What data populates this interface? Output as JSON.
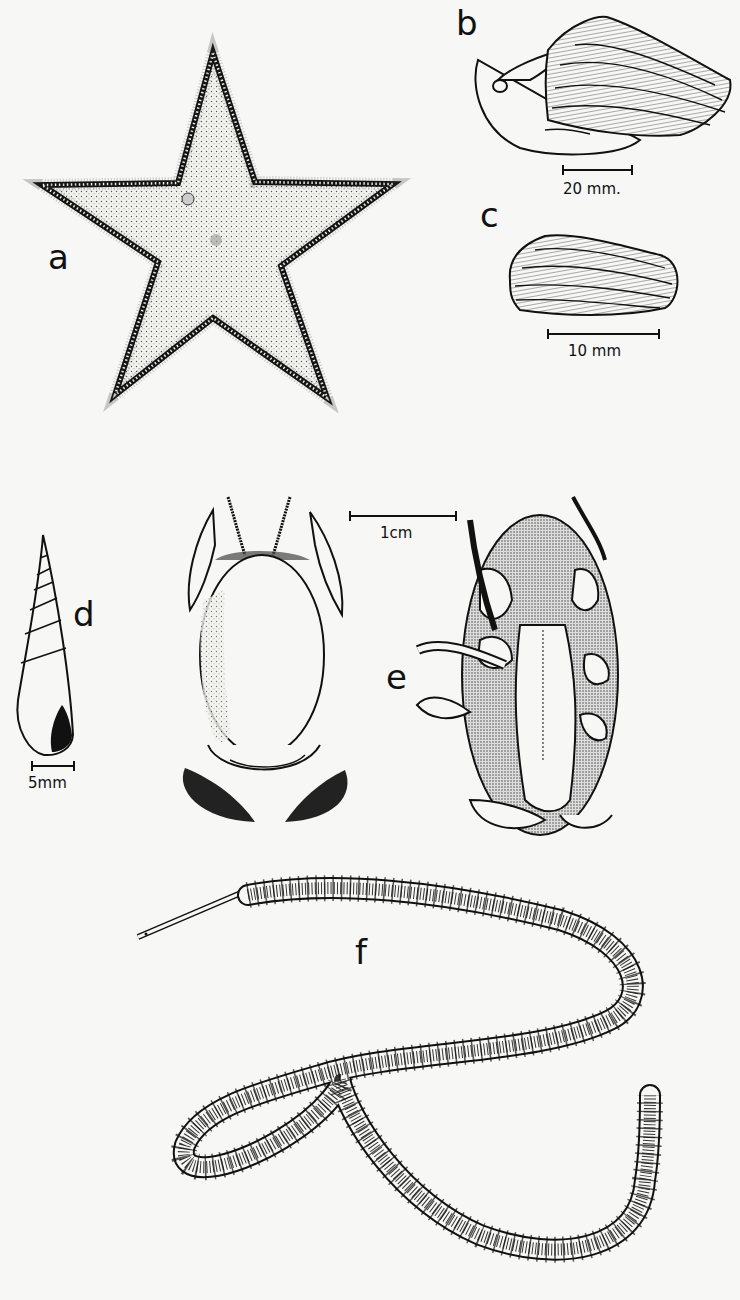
{
  "figure": {
    "panels": [
      {
        "id": "a",
        "label": "a",
        "subject": "starfish",
        "scale": null
      },
      {
        "id": "b",
        "label": "b",
        "subject": "bivalve-with-foot-extended",
        "scale": "20 mm."
      },
      {
        "id": "c",
        "label": "c",
        "subject": "bivalve-shell",
        "scale": "10 mm"
      },
      {
        "id": "d",
        "label": "d",
        "subject": "turret-snail-shell",
        "scale": "5mm"
      },
      {
        "id": "e",
        "label": "e",
        "subject": "crab-dorsal-and-ventral-views",
        "scale": "1cm"
      },
      {
        "id": "f",
        "label": "f",
        "subject": "ribbon-worm",
        "scale": null
      }
    ]
  },
  "colors": {
    "paper": "#f7f7f5",
    "ink": "#111111",
    "stipple": "#e2e2de"
  }
}
